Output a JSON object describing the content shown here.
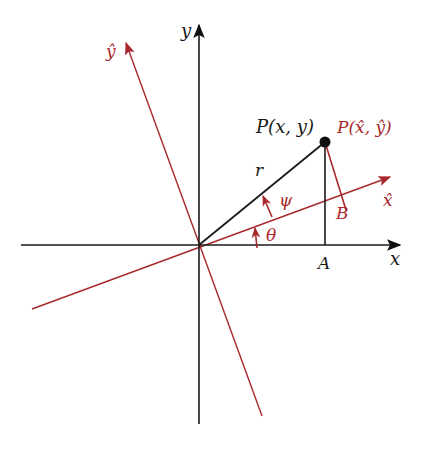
{
  "colors": {
    "black_axis": "#1a1a1a",
    "rotated_axis": "#a8282c",
    "background": "#ffffff"
  },
  "labels": {
    "x_axis": "x",
    "y_axis": "y",
    "x_hat_axis": "x̂",
    "y_hat_axis": "ŷ",
    "point_original": "P(x, y)",
    "point_rotated": "P(x̂, ŷ)",
    "radius": "r",
    "angle_theta": "θ",
    "angle_psi": "ψ",
    "foot_A": "A",
    "foot_B": "B"
  },
  "geometry": {
    "origin": [
      199,
      245
    ],
    "point_P": [
      325,
      142
    ],
    "foot_A": [
      325,
      245
    ],
    "foot_B": [
      346,
      210
    ]
  }
}
